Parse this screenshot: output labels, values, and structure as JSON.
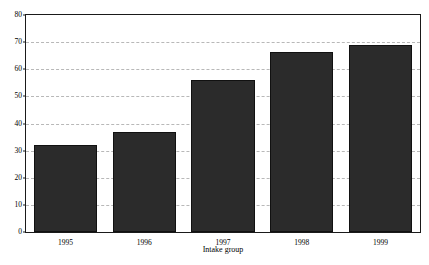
{
  "chart_data": {
    "type": "bar",
    "title": "",
    "subtitle": "",
    "xlabel": "Intake group",
    "ylabel": "",
    "categories": [
      "1995",
      "1996",
      "1997",
      "1998",
      "1999"
    ],
    "values": [
      32,
      37,
      56,
      66.5,
      69
    ],
    "series": [
      {
        "name": "Intake",
        "values": [
          32,
          37,
          56,
          66.5,
          69
        ]
      }
    ],
    "ylim": [
      0,
      80
    ],
    "y_ticks": [
      0,
      10,
      20,
      30,
      40,
      50,
      60,
      70,
      80
    ],
    "y_tick_labels": [
      "0",
      "10",
      "20",
      "30",
      "40",
      "50",
      "60",
      "70",
      "80"
    ],
    "grid": true,
    "grid_axis": "y",
    "grid_style": "dashed",
    "legend": false,
    "legend_position": "none",
    "annotations": [],
    "bar_color": "#2b2b2b",
    "bar_edge_color": "#111111",
    "grid_color": "#b8b8b8",
    "frame_color": "#1a1a1a",
    "background_color": "#ffffff"
  }
}
